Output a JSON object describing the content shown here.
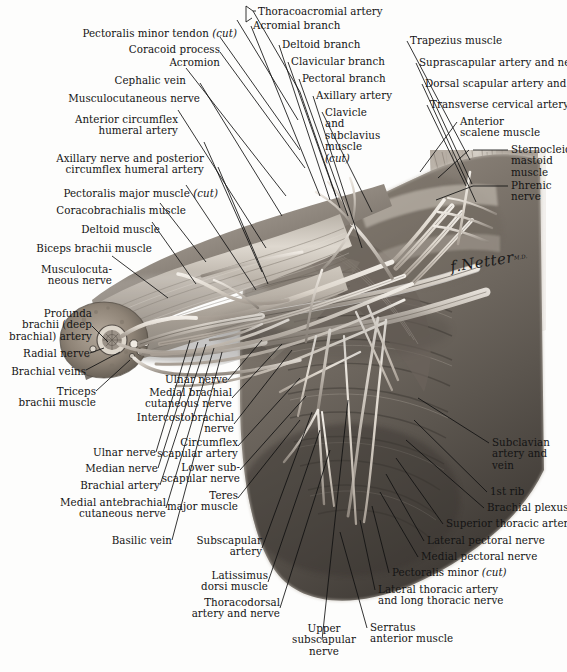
{
  "plate": {
    "title": "Axilla (Anterior View) — Brachial Plexus and Axillary Artery",
    "signature": "Netter",
    "signature_prefix": "f.",
    "signature_suffix": "M.D.",
    "footnote": ""
  },
  "style": {
    "label_color": "#141414",
    "leader_color": "#111111",
    "background": "#fdfdfc",
    "art_light": "#e6e2db",
    "art_mid": "#9c938a",
    "art_dark": "#4a443e"
  },
  "labels": [
    {
      "id": "pectoralis-minor-tendon-cut",
      "text": "Pectoralis minor tendon (cut)",
      "italic_tail": "(cut)"
    },
    {
      "id": "coracoid-process",
      "text": "Coracoid process"
    },
    {
      "id": "acromion",
      "text": "Acromion"
    },
    {
      "id": "cephalic-vein",
      "text": "Cephalic vein"
    },
    {
      "id": "musculocutaneous-nerve-top",
      "text": "Musculocutaneous nerve"
    },
    {
      "id": "anterior-circumflex-humeral-artery",
      "text": "Anterior circumflex\nhumeral artery"
    },
    {
      "id": "axillary-nerve-posterior-circumflex",
      "text": "Axillary nerve and posterior\ncircumflex humeral artery"
    },
    {
      "id": "pectoralis-major-muscle-cut",
      "text": "Pectoralis major muscle (cut)"
    },
    {
      "id": "coracobrachialis-muscle",
      "text": "Coracobrachialis muscle"
    },
    {
      "id": "deltoid-muscle",
      "text": "Deltoid muscle"
    },
    {
      "id": "biceps-brachii-muscle",
      "text": "Biceps brachii muscle"
    },
    {
      "id": "musculocutaneous-nerve-arm",
      "text": "Musculocuta-\nneous nerve"
    },
    {
      "id": "profunda-brachii-artery",
      "text": "Profunda\nbrachii (deep\nbrachial) artery"
    },
    {
      "id": "radial-nerve",
      "text": "Radial nerve"
    },
    {
      "id": "brachial-veins",
      "text": "Brachial veins"
    },
    {
      "id": "triceps-brachii-muscle",
      "text": "Triceps\nbrachii muscle"
    },
    {
      "id": "ulnar-nerve-lower-left",
      "text": "Ulnar nerve"
    },
    {
      "id": "median-nerve",
      "text": "Median nerve"
    },
    {
      "id": "brachial-artery",
      "text": "Brachial artery"
    },
    {
      "id": "medial-antebrachial-cutaneous-nerve",
      "text": "Medial antebrachial\ncutaneous nerve"
    },
    {
      "id": "basilic-vein",
      "text": "Basilic vein"
    },
    {
      "id": "thoracoacromial-artery",
      "text": "Thoracoacromial artery"
    },
    {
      "id": "acromial-branch",
      "text": "Acromial branch"
    },
    {
      "id": "deltoid-branch",
      "text": "Deltoid branch"
    },
    {
      "id": "clavicular-branch",
      "text": "Clavicular branch"
    },
    {
      "id": "pectoral-branch",
      "text": "Pectoral branch"
    },
    {
      "id": "axillary-artery",
      "text": "Axillary artery"
    },
    {
      "id": "clavicle-and-subclavius-muscle-cut",
      "text": "Clavicle\nand\nsubclavius\nmuscle\n(cut)",
      "italic_tail": "(cut)"
    },
    {
      "id": "trapezius-muscle",
      "text": "Trapezius muscle"
    },
    {
      "id": "suprascapular-artery-and-nerve",
      "text": "Suprascapular artery and nerve"
    },
    {
      "id": "dorsal-scapular-artery-and-nerve",
      "text": "Dorsal scapular artery and nerve"
    },
    {
      "id": "transverse-cervical-artery",
      "text": "Transverse cervical artery"
    },
    {
      "id": "anterior-scalene-muscle",
      "text": "Anterior\nscalene muscle"
    },
    {
      "id": "sternocleidomastoid-muscle",
      "text": "Sternocleido-\nmastoid\nmuscle"
    },
    {
      "id": "phrenic-nerve",
      "text": "Phrenic\nnerve"
    },
    {
      "id": "ulnar-nerve-mid",
      "text": "Ulnar nerve"
    },
    {
      "id": "medial-brachial-cutaneous-nerve",
      "text": "Medial brachial\ncutaneous nerve"
    },
    {
      "id": "intercostobrachial-nerve",
      "text": "Intercostobrachial\nnerve"
    },
    {
      "id": "circumflex-scapular-artery",
      "text": "Circumflex\nscapular artery"
    },
    {
      "id": "lower-subscapular-nerve",
      "text": "Lower sub-\nscapular nerve"
    },
    {
      "id": "teres-major-muscle",
      "text": "Teres\nmajor muscle"
    },
    {
      "id": "subscapular-artery",
      "text": "Subscapular\nartery"
    },
    {
      "id": "latissimus-dorsi-muscle",
      "text": "Latissimus\ndorsi muscle"
    },
    {
      "id": "thoracodorsal-artery-and-nerve",
      "text": "Thoracodorsal\nartery and nerve"
    },
    {
      "id": "upper-subscapular-nerve",
      "text": "Upper\nsubscapular\nnerve"
    },
    {
      "id": "subclavian-artery-and-vein",
      "text": "Subclavian\nartery and\nvein"
    },
    {
      "id": "first-rib",
      "text": "1st rib"
    },
    {
      "id": "brachial-plexus",
      "text": "Brachial plexus"
    },
    {
      "id": "superior-thoracic-artery",
      "text": "Superior thoracic artery"
    },
    {
      "id": "lateral-pectoral-nerve",
      "text": "Lateral pectoral nerve"
    },
    {
      "id": "medial-pectoral-nerve",
      "text": "Medial pectoral nerve"
    },
    {
      "id": "pectoralis-minor-cut",
      "text": "Pectoralis minor (cut)",
      "italic_tail": "(cut)"
    },
    {
      "id": "lateral-thoracic-artery-long-thoracic-nerve",
      "text": "Lateral thoracic artery\nand long thoracic nerve"
    },
    {
      "id": "serratus-anterior-muscle",
      "text": "Serratus\nanterior muscle"
    }
  ]
}
